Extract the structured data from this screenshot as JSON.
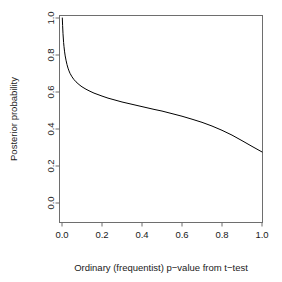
{
  "chart_data": {
    "type": "line",
    "title": "",
    "subtitle": "",
    "xlabel": "Ordinary (frequentist) p−value from t−test",
    "ylabel": "Posterior probability",
    "xlim": [
      0.0,
      1.0
    ],
    "ylim": [
      0.0,
      1.0
    ],
    "grid": false,
    "legend": "none",
    "x_ticks": [
      {
        "value": 0.0,
        "label": "0.0"
      },
      {
        "value": 0.2,
        "label": "0.2"
      },
      {
        "value": 0.4,
        "label": "0.4"
      },
      {
        "value": 0.6,
        "label": "0.6"
      },
      {
        "value": 0.8,
        "label": "0.8"
      },
      {
        "value": 1.0,
        "label": "1.0"
      }
    ],
    "y_ticks": [
      {
        "value": 0.0,
        "label": "0.0"
      },
      {
        "value": 0.2,
        "label": "0.2"
      },
      {
        "value": 0.4,
        "label": "0.4"
      },
      {
        "value": 0.6,
        "label": "0.6"
      },
      {
        "value": 0.8,
        "label": "0.8"
      },
      {
        "value": 1.0,
        "label": "1.0"
      }
    ],
    "series": [
      {
        "name": "posterior probability lower bound",
        "color": "#000000",
        "x": [
          0.0015,
          0.003,
          0.005,
          0.008,
          0.01,
          0.013,
          0.016,
          0.02,
          0.025,
          0.03,
          0.035,
          0.04,
          0.05,
          0.06,
          0.07,
          0.08,
          0.09,
          0.1,
          0.12,
          0.14,
          0.16,
          0.18,
          0.2,
          0.23,
          0.26,
          0.3,
          0.34,
          0.38,
          0.42,
          0.46,
          0.5,
          0.55,
          0.6,
          0.65,
          0.7,
          0.75,
          0.8,
          0.85,
          0.9,
          0.95,
          1.0
        ],
        "y": [
          1.0,
          0.96,
          0.915,
          0.868,
          0.845,
          0.817,
          0.795,
          0.772,
          0.748,
          0.729,
          0.714,
          0.701,
          0.682,
          0.667,
          0.655,
          0.645,
          0.636,
          0.628,
          0.615,
          0.604,
          0.594,
          0.586,
          0.578,
          0.567,
          0.558,
          0.546,
          0.536,
          0.526,
          0.516,
          0.506,
          0.497,
          0.483,
          0.469,
          0.453,
          0.436,
          0.416,
          0.393,
          0.367,
          0.337,
          0.306,
          0.276
        ]
      }
    ]
  },
  "axes": {
    "x_axis_name": "x-axis",
    "y_axis_name": "y-axis"
  }
}
